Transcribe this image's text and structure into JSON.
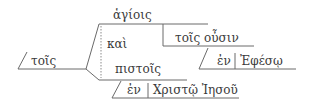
{
  "diagram": {
    "type": "sentence-diagram",
    "language": "Greek",
    "words": {
      "article": "τοῖς",
      "top": "ἁγίοις",
      "conj": "καὶ",
      "bottom": "πιστοῖς",
      "participle": "τοῖς οὖσιν",
      "prep1": "ἐν",
      "obj1": "Ἐφέσῳ",
      "prep2": "ἐν",
      "obj2": "Χριστῷ Ἰησοῦ"
    },
    "colors": {
      "line": "#6a6a6a",
      "text": "#3a3a3a",
      "background": "#ffffff"
    }
  }
}
